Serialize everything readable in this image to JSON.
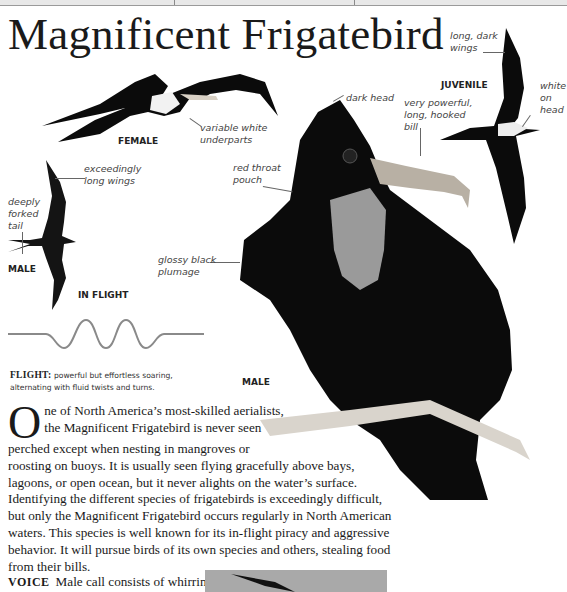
{
  "page": {
    "title": "Magnificent Frigatebird"
  },
  "illustrations": {
    "female": {
      "tag": "FEMALE",
      "callouts": [
        {
          "text_line1": "variable white",
          "text_line2": "underparts"
        }
      ]
    },
    "juvenile": {
      "tag": "JUVENILE",
      "callouts": [
        {
          "text_line1": "long, dark",
          "text_line2": "wings"
        },
        {
          "text_line1": "white",
          "text_line2": "on",
          "text_line3": "head"
        }
      ]
    },
    "male_in_flight": {
      "tag_male": "MALE",
      "tag_flight": "IN FLIGHT",
      "callouts": [
        {
          "text_line1": "exceedingly",
          "text_line2": "long wings"
        },
        {
          "text_line1": "deeply",
          "text_line2": "forked",
          "text_line3": "tail"
        }
      ]
    },
    "male_perched": {
      "tag": "MALE",
      "callouts": [
        {
          "text_line1": "dark head"
        },
        {
          "text_line1": "very powerful,",
          "text_line2": "long, hooked",
          "text_line3": "bill"
        },
        {
          "text_line1": "red throat",
          "text_line2": "pouch"
        },
        {
          "text_line1": "glossy black",
          "text_line2": "plumage"
        }
      ]
    }
  },
  "flight": {
    "label": "FLIGHT:",
    "description_line1": " powerful but effortless soaring,",
    "description_line2": "alternating with fluid twists and turns."
  },
  "description": {
    "dropcap": "O",
    "lines": [
      "ne of North America’s most-skilled aerialists,",
      "the Magnificent Frigatebird is never seen",
      "perched except when nesting in mangroves or",
      "roosting on buoys. It is usually seen flying gracefully above bays,",
      "lagoons, or open ocean, but it never alights on the water’s surface.",
      "Identifying the different species of frigatebirds is exceedingly difficult,",
      "but only the Magnificent Frigatebird occurs regularly in North American",
      "waters. This species is well known for its in-flight piracy and aggressive",
      "behavior. It will pursue birds of its own species and others, stealing food",
      "from their bills."
    ]
  },
  "voice": {
    "label": "VOICE",
    "text": "Male call consists of whirring,"
  },
  "colors": {
    "text": "#1a1a1a",
    "label": "#444444",
    "bird_black": "#0b0b0b",
    "pouch_gray": "#9a9a9a",
    "wave": "#8a8a8a",
    "photo_box": "#a9a9a9"
  }
}
